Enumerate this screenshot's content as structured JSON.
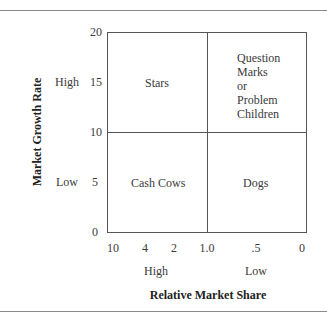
{
  "diagram": {
    "type": "bcg-growth-share-matrix",
    "y_axis": {
      "title": "Market Growth Rate",
      "ticks": [
        "20",
        "15",
        "10",
        "5",
        "0"
      ],
      "levels": [
        "High",
        "Low"
      ]
    },
    "x_axis": {
      "title": "Relative Market Share",
      "ticks": [
        "10",
        "4",
        "2",
        "1.0",
        ".5",
        "0"
      ],
      "levels": [
        "High",
        "Low"
      ]
    },
    "quadrants": {
      "top_left": "Stars",
      "top_right": [
        "Question",
        "Marks",
        "or",
        "Problem",
        "Children"
      ],
      "bottom_left": "Cash Cows",
      "bottom_right": "Dogs"
    }
  }
}
